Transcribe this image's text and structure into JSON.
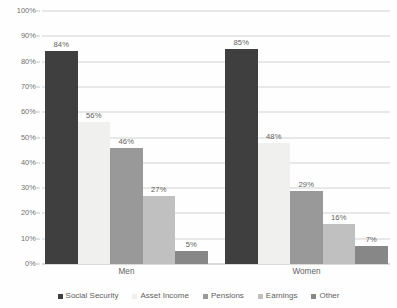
{
  "chart_data": {
    "type": "bar",
    "title": "",
    "subtitle": "",
    "xlabel": "",
    "ylabel": "",
    "ylim": [
      0,
      100
    ],
    "y_tick_labels": [
      "0%",
      "10%",
      "20%",
      "30%",
      "40%",
      "50%",
      "60%",
      "70%",
      "80%",
      "90%",
      "100%"
    ],
    "y_tick_values": [
      0,
      10,
      20,
      30,
      40,
      50,
      60,
      70,
      80,
      90,
      100
    ],
    "grid": true,
    "grid_axis": "y",
    "legend_position": "bottom",
    "categories": [
      "Men",
      "Women"
    ],
    "series": [
      {
        "name": "Social Security",
        "color": "#161616",
        "values": [
          84,
          85
        ],
        "labels": [
          "84%",
          "85%"
        ]
      },
      {
        "name": "Asset Income",
        "color": "#eeeeec",
        "values": [
          56,
          48
        ],
        "labels": [
          "56%",
          "48%"
        ]
      },
      {
        "name": "Pensions",
        "color": "#848484",
        "values": [
          46,
          29
        ],
        "labels": [
          "46%",
          "29%"
        ]
      },
      {
        "name": "Earnings",
        "color": "#b4b4b4",
        "values": [
          27,
          16
        ],
        "labels": [
          "27%",
          "16%"
        ]
      },
      {
        "name": "Other",
        "color": "#6e6e6e",
        "values": [
          5,
          7
        ],
        "labels": [
          "5%",
          "7%"
        ]
      }
    ]
  },
  "legend": {
    "items": [
      {
        "label": "Social Security",
        "color": "#161616"
      },
      {
        "label": "Asset Income",
        "color": "#eeeeec"
      },
      {
        "label": "Pensions",
        "color": "#848484"
      },
      {
        "label": "Earnings",
        "color": "#b4b4b4"
      },
      {
        "label": "Other",
        "color": "#6e6e6e"
      }
    ]
  }
}
